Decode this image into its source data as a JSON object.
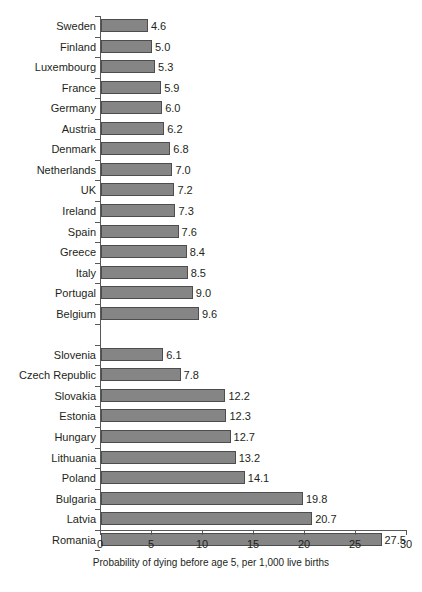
{
  "chart_data": {
    "type": "bar",
    "orientation": "horizontal",
    "title": "",
    "xlabel": "Probability of dying before age 5, per 1,000 live births",
    "ylabel": "",
    "xlim": [
      0,
      30
    ],
    "xticks": [
      "0",
      "5",
      "10",
      "15",
      "20",
      "25",
      "30"
    ],
    "grid": false,
    "legend": null,
    "bar_color": "#858585",
    "bar_border_color": "#4d4d4d",
    "axis_color": "#58595b",
    "text_color": "#231f20",
    "categories": [
      "Sweden",
      "Finland",
      "Luxembourg",
      "France",
      "Germany",
      "Austria",
      "Denmark",
      "Netherlands",
      "UK",
      "Ireland",
      "Spain",
      "Greece",
      "Italy",
      "Portugal",
      "Belgium",
      "Slovenia",
      "Czech Republic",
      "Slovakia",
      "Estonia",
      "Hungary",
      "Lithuania",
      "Poland",
      "Bulgaria",
      "Latvia",
      "Romania"
    ],
    "values": [
      4.6,
      5.0,
      5.3,
      5.9,
      6.0,
      6.2,
      6.8,
      7.0,
      7.2,
      7.3,
      7.6,
      8.4,
      8.5,
      9.0,
      9.6,
      6.1,
      7.8,
      12.2,
      12.3,
      12.7,
      13.2,
      14.1,
      19.8,
      20.7,
      27.5
    ],
    "value_labels": [
      "4.6",
      "5.0",
      "5.3",
      "5.9",
      "6.0",
      "6.2",
      "6.8",
      "7.0",
      "7.2",
      "7.3",
      "7.6",
      "8.4",
      "8.5",
      "9.0",
      "9.6",
      "6.1",
      "7.8",
      "12.2",
      "12.3",
      "12.7",
      "13.2",
      "14.1",
      "19.8",
      "20.7",
      "27.5"
    ],
    "group_break_after_index": 14,
    "rows": [
      {
        "label": "Sweden",
        "value": 4.6,
        "value_label": "4.6",
        "group": 1
      },
      {
        "label": "Finland",
        "value": 5.0,
        "value_label": "5.0",
        "group": 1
      },
      {
        "label": "Luxembourg",
        "value": 5.3,
        "value_label": "5.3",
        "group": 1
      },
      {
        "label": "France",
        "value": 5.9,
        "value_label": "5.9",
        "group": 1
      },
      {
        "label": "Germany",
        "value": 6.0,
        "value_label": "6.0",
        "group": 1
      },
      {
        "label": "Austria",
        "value": 6.2,
        "value_label": "6.2",
        "group": 1
      },
      {
        "label": "Denmark",
        "value": 6.8,
        "value_label": "6.8",
        "group": 1
      },
      {
        "label": "Netherlands",
        "value": 7.0,
        "value_label": "7.0",
        "group": 1
      },
      {
        "label": "UK",
        "value": 7.2,
        "value_label": "7.2",
        "group": 1
      },
      {
        "label": "Ireland",
        "value": 7.3,
        "value_label": "7.3",
        "group": 1
      },
      {
        "label": "Spain",
        "value": 7.6,
        "value_label": "7.6",
        "group": 1
      },
      {
        "label": "Greece",
        "value": 8.4,
        "value_label": "8.4",
        "group": 1
      },
      {
        "label": "Italy",
        "value": 8.5,
        "value_label": "8.5",
        "group": 1
      },
      {
        "label": "Portugal",
        "value": 9.0,
        "value_label": "9.0",
        "group": 1
      },
      {
        "label": "Belgium",
        "value": 9.6,
        "value_label": "9.6",
        "group": 1
      },
      {
        "label": "",
        "value": null,
        "value_label": "",
        "group": 0
      },
      {
        "label": "Slovenia",
        "value": 6.1,
        "value_label": "6.1",
        "group": 2
      },
      {
        "label": "Czech Republic",
        "value": 7.8,
        "value_label": "7.8",
        "group": 2
      },
      {
        "label": "Slovakia",
        "value": 12.2,
        "value_label": "12.2",
        "group": 2
      },
      {
        "label": "Estonia",
        "value": 12.3,
        "value_label": "12.3",
        "group": 2
      },
      {
        "label": "Hungary",
        "value": 12.7,
        "value_label": "12.7",
        "group": 2
      },
      {
        "label": "Lithuania",
        "value": 13.2,
        "value_label": "13.2",
        "group": 2
      },
      {
        "label": "Poland",
        "value": 14.1,
        "value_label": "14.1",
        "group": 2
      },
      {
        "label": "Bulgaria",
        "value": 19.8,
        "value_label": "19.8",
        "group": 2
      },
      {
        "label": "Latvia",
        "value": 20.7,
        "value_label": "20.7",
        "group": 2
      },
      {
        "label": "Romania",
        "value": 27.5,
        "value_label": "27.5",
        "group": 2
      }
    ]
  },
  "cut_title_fragment": ""
}
